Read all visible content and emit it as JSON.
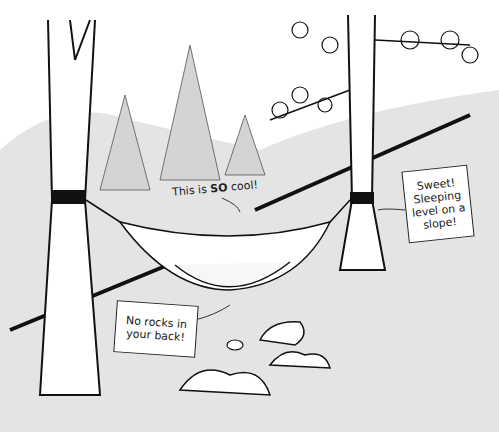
{
  "illustration": {
    "subject": "hammock strung between two trees on a forested slope",
    "speech": {
      "prefix": "This is ",
      "emphasis": "SO",
      "suffix": " cool!"
    },
    "callouts": [
      {
        "text": "Sweet! Sleeping level on a slope!"
      },
      {
        "text": "No rocks in your back!"
      }
    ],
    "colors": {
      "background": "#e6e6e6",
      "ink": "#222222",
      "paper": "#ffffff"
    }
  }
}
